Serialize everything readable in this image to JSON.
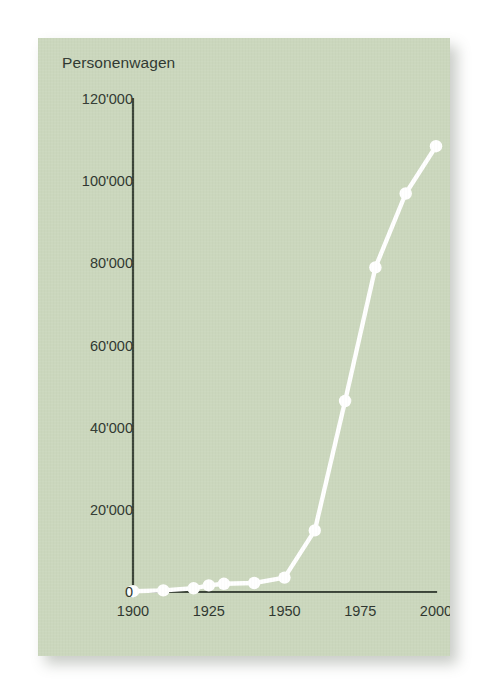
{
  "card": {
    "background_color": "#cbd7bd",
    "page_background_color": "#ffffff"
  },
  "chart_data": {
    "type": "line",
    "title": "Personenwagen",
    "subtitle": "",
    "xlabel": "",
    "ylabel": "",
    "series_color": "#ffffff",
    "axis_color": "#3b4438",
    "marker": "circle",
    "grid": false,
    "legend": null,
    "xlim": [
      1900,
      2000
    ],
    "ylim": [
      0,
      120000
    ],
    "x_tick_labels": [
      "1900",
      "1925",
      "1950",
      "1975",
      "2000"
    ],
    "x_ticks": [
      1900,
      1925,
      1950,
      1975,
      2000
    ],
    "y_tick_labels": [
      "0",
      "20'000",
      "40'000",
      "60'000",
      "80'000",
      "100'000",
      "120'000"
    ],
    "y_ticks": [
      0,
      20000,
      40000,
      60000,
      80000,
      100000,
      120000
    ],
    "thousands_separator": "'",
    "x": [
      1900,
      1910,
      1920,
      1925,
      1930,
      1940,
      1950,
      1960,
      1970,
      1980,
      1990,
      2000
    ],
    "values": [
      200,
      400,
      900,
      1600,
      2000,
      2200,
      3500,
      15000,
      46500,
      79000,
      97000,
      108500
    ],
    "points": [
      {
        "x": 1900,
        "y": 200
      },
      {
        "x": 1910,
        "y": 400
      },
      {
        "x": 1920,
        "y": 900
      },
      {
        "x": 1925,
        "y": 1600
      },
      {
        "x": 1930,
        "y": 2000
      },
      {
        "x": 1940,
        "y": 2200
      },
      {
        "x": 1950,
        "y": 3500
      },
      {
        "x": 1960,
        "y": 15000
      },
      {
        "x": 1970,
        "y": 46500
      },
      {
        "x": 1980,
        "y": 79000
      },
      {
        "x": 1990,
        "y": 97000
      },
      {
        "x": 2000,
        "y": 108500
      }
    ]
  }
}
